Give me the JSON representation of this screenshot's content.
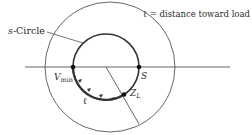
{
  "diagram": {
    "legend": "ℓ = distance toward load",
    "labels": {
      "s_circle": "s-Circle",
      "s_circle_prefix": "s",
      "s_circle_suffix": "-Circle",
      "vmin_main": "V",
      "vmin_sub": "min",
      "s_point": "S",
      "zl_main": "Z",
      "zl_sub": "L",
      "ell": "ℓ"
    },
    "colors": {
      "stroke": "#4a4a4a",
      "arc": "#333333",
      "text": "#2a2a2a",
      "background": "#ffffff"
    }
  }
}
